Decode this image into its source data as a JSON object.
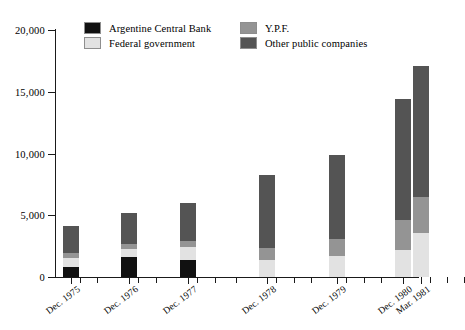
{
  "chart_data": {
    "type": "bar",
    "subtype": "stacked",
    "title": "",
    "xlabel": "",
    "ylabel": "",
    "ylim": [
      0,
      20000
    ],
    "ytick_values": [
      0,
      5000,
      10000,
      15000,
      20000
    ],
    "ytick_labels": [
      "0",
      "5,000",
      "10,000",
      "15,000",
      "20,000"
    ],
    "grid": false,
    "legend_position": "top-center",
    "categories": [
      "Dec. 1975",
      "Dec. 1976",
      "Dec. 1977",
      "Dec. 1978",
      "Dec. 1979",
      "Dec. 1980",
      "Mar. 1981"
    ],
    "series": [
      {
        "name": "Argentine Central Bank",
        "color": "#111111",
        "values": [
          800,
          1650,
          1350,
          0,
          0,
          0,
          0
        ]
      },
      {
        "name": "Federal government",
        "color": "#e2e2e2",
        "values": [
          700,
          600,
          1050,
          1400,
          1700,
          2200,
          3550
        ]
      },
      {
        "name": "Y.P.F.",
        "color": "#949494",
        "values": [
          450,
          450,
          500,
          950,
          1350,
          2450,
          2900
        ]
      },
      {
        "name": "Other public companies",
        "color": "#545454",
        "values": [
          2150,
          2500,
          3100,
          5950,
          6850,
          9750,
          10650
        ]
      }
    ],
    "totals": [
      4100,
      5200,
      6000,
      8300,
      9900,
      14400,
      17100
    ]
  },
  "legend": {
    "items": [
      {
        "label": "Argentine Central Bank",
        "swatch_name": "legend-swatch-argentine-central-bank"
      },
      {
        "label": "Federal government",
        "swatch_name": "legend-swatch-federal-government"
      },
      {
        "label": "Y.P.F.",
        "swatch_name": "legend-swatch-ypf"
      },
      {
        "label": "Other public companies",
        "swatch_name": "legend-swatch-other-public-companies"
      }
    ]
  },
  "colors": {
    "argentine_central_bank": "#111111",
    "federal_government": "#e2e2e2",
    "ypf": "#949494",
    "other_public_companies": "#545454",
    "axis": "#1a1a1a",
    "background": "#ffffff"
  }
}
